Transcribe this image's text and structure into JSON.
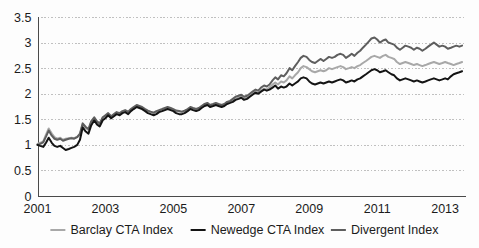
{
  "chart_data": {
    "type": "line",
    "title": "",
    "subtitle": "",
    "xlabel": "",
    "ylabel": "",
    "xlim": [
      2001,
      2013.6
    ],
    "ylim": [
      0,
      3.5
    ],
    "grid": true,
    "grid_axis": "y",
    "legend_position": "bottom",
    "xticks": [
      "2001",
      "2003",
      "2005",
      "2007",
      "2009",
      "2011",
      "2013"
    ],
    "xtick_values": [
      2001,
      2003,
      2005,
      2007,
      2009,
      2011,
      2013
    ],
    "yticks": [
      "0",
      "0.5",
      "1",
      "1.5",
      "2",
      "2.5",
      "3",
      "3.5"
    ],
    "ytick_values": [
      0,
      0.5,
      1,
      1.5,
      2,
      2.5,
      3,
      3.5
    ],
    "x": [
      2001.0,
      2001.08,
      2001.17,
      2001.25,
      2001.33,
      2001.42,
      2001.5,
      2001.58,
      2001.67,
      2001.75,
      2001.83,
      2001.92,
      2002.0,
      2002.08,
      2002.17,
      2002.25,
      2002.33,
      2002.42,
      2002.5,
      2002.58,
      2002.67,
      2002.75,
      2002.83,
      2002.92,
      2003.0,
      2003.08,
      2003.17,
      2003.25,
      2003.33,
      2003.42,
      2003.5,
      2003.58,
      2003.67,
      2003.75,
      2003.83,
      2003.92,
      2004.0,
      2004.08,
      2004.17,
      2004.25,
      2004.33,
      2004.42,
      2004.5,
      2004.58,
      2004.67,
      2004.75,
      2004.83,
      2004.92,
      2005.0,
      2005.08,
      2005.17,
      2005.25,
      2005.33,
      2005.42,
      2005.5,
      2005.58,
      2005.67,
      2005.75,
      2005.83,
      2005.92,
      2006.0,
      2006.08,
      2006.17,
      2006.25,
      2006.33,
      2006.42,
      2006.5,
      2006.58,
      2006.67,
      2006.75,
      2006.83,
      2006.92,
      2007.0,
      2007.08,
      2007.17,
      2007.25,
      2007.33,
      2007.42,
      2007.5,
      2007.58,
      2007.67,
      2007.75,
      2007.83,
      2007.92,
      2008.0,
      2008.08,
      2008.17,
      2008.25,
      2008.33,
      2008.42,
      2008.5,
      2008.58,
      2008.67,
      2008.75,
      2008.83,
      2008.92,
      2009.0,
      2009.08,
      2009.17,
      2009.25,
      2009.33,
      2009.42,
      2009.5,
      2009.58,
      2009.67,
      2009.75,
      2009.83,
      2009.92,
      2010.0,
      2010.08,
      2010.17,
      2010.25,
      2010.33,
      2010.42,
      2010.5,
      2010.58,
      2010.67,
      2010.75,
      2010.83,
      2010.92,
      2011.0,
      2011.08,
      2011.17,
      2011.25,
      2011.33,
      2011.42,
      2011.5,
      2011.58,
      2011.67,
      2011.75,
      2011.83,
      2011.92,
      2012.0,
      2012.08,
      2012.17,
      2012.25,
      2012.33,
      2012.42,
      2012.5,
      2012.58,
      2012.67,
      2012.75,
      2012.83,
      2012.92,
      2013.0,
      2013.08,
      2013.17,
      2013.25,
      2013.33,
      2013.42,
      2013.5
    ],
    "series": [
      {
        "name": "Barclay CTA Index",
        "color": "#a8a8a8",
        "width": 2.0,
        "values": [
          1.02,
          1.04,
          1.07,
          1.2,
          1.32,
          1.22,
          1.15,
          1.12,
          1.14,
          1.1,
          1.12,
          1.13,
          1.14,
          1.13,
          1.16,
          1.2,
          1.4,
          1.33,
          1.29,
          1.44,
          1.52,
          1.44,
          1.4,
          1.52,
          1.56,
          1.6,
          1.55,
          1.58,
          1.62,
          1.6,
          1.64,
          1.66,
          1.63,
          1.68,
          1.72,
          1.76,
          1.74,
          1.72,
          1.68,
          1.66,
          1.64,
          1.62,
          1.64,
          1.66,
          1.68,
          1.7,
          1.72,
          1.7,
          1.68,
          1.66,
          1.65,
          1.64,
          1.66,
          1.68,
          1.72,
          1.7,
          1.68,
          1.7,
          1.74,
          1.78,
          1.8,
          1.76,
          1.78,
          1.8,
          1.78,
          1.76,
          1.78,
          1.82,
          1.84,
          1.86,
          1.9,
          1.92,
          1.94,
          1.9,
          1.92,
          1.96,
          2.0,
          2.04,
          2.02,
          2.06,
          2.1,
          2.08,
          2.12,
          2.18,
          2.22,
          2.18,
          2.24,
          2.22,
          2.26,
          2.34,
          2.3,
          2.36,
          2.42,
          2.5,
          2.54,
          2.52,
          2.48,
          2.44,
          2.42,
          2.44,
          2.46,
          2.44,
          2.46,
          2.5,
          2.48,
          2.5,
          2.52,
          2.54,
          2.52,
          2.48,
          2.5,
          2.52,
          2.5,
          2.54,
          2.56,
          2.6,
          2.64,
          2.68,
          2.72,
          2.74,
          2.72,
          2.7,
          2.74,
          2.76,
          2.72,
          2.7,
          2.68,
          2.62,
          2.58,
          2.6,
          2.62,
          2.6,
          2.58,
          2.56,
          2.58,
          2.56,
          2.54,
          2.56,
          2.58,
          2.6,
          2.62,
          2.6,
          2.58,
          2.6,
          2.62,
          2.6,
          2.58,
          2.56,
          2.58,
          2.6,
          2.62
        ]
      },
      {
        "name": "Newedge CTA Index",
        "color": "#141414",
        "width": 2.0,
        "values": [
          1.0,
          0.98,
          0.96,
          1.04,
          1.14,
          1.04,
          0.98,
          0.96,
          0.98,
          0.94,
          0.9,
          0.92,
          0.94,
          0.96,
          1.0,
          1.1,
          1.34,
          1.26,
          1.22,
          1.38,
          1.48,
          1.4,
          1.36,
          1.48,
          1.52,
          1.58,
          1.52,
          1.56,
          1.6,
          1.58,
          1.62,
          1.64,
          1.6,
          1.66,
          1.7,
          1.74,
          1.72,
          1.7,
          1.66,
          1.62,
          1.6,
          1.58,
          1.6,
          1.64,
          1.66,
          1.68,
          1.7,
          1.68,
          1.66,
          1.62,
          1.6,
          1.6,
          1.62,
          1.66,
          1.7,
          1.68,
          1.66,
          1.68,
          1.72,
          1.76,
          1.78,
          1.74,
          1.76,
          1.78,
          1.76,
          1.74,
          1.76,
          1.8,
          1.82,
          1.84,
          1.88,
          1.9,
          1.92,
          1.88,
          1.9,
          1.94,
          1.98,
          2.02,
          2.0,
          2.04,
          2.08,
          2.06,
          2.08,
          2.12,
          2.16,
          2.1,
          2.14,
          2.12,
          2.14,
          2.2,
          2.16,
          2.2,
          2.24,
          2.3,
          2.32,
          2.3,
          2.24,
          2.2,
          2.18,
          2.2,
          2.22,
          2.2,
          2.22,
          2.24,
          2.22,
          2.24,
          2.26,
          2.28,
          2.26,
          2.22,
          2.24,
          2.26,
          2.24,
          2.28,
          2.3,
          2.34,
          2.38,
          2.42,
          2.46,
          2.48,
          2.46,
          2.42,
          2.44,
          2.46,
          2.42,
          2.38,
          2.36,
          2.3,
          2.26,
          2.28,
          2.3,
          2.28,
          2.26,
          2.24,
          2.26,
          2.24,
          2.22,
          2.24,
          2.26,
          2.28,
          2.3,
          2.28,
          2.26,
          2.28,
          2.3,
          2.28,
          2.34,
          2.38,
          2.4,
          2.42,
          2.44
        ]
      },
      {
        "name": "Divergent Index",
        "color": "#5e5e5e",
        "width": 2.0,
        "values": [
          1.0,
          1.02,
          1.05,
          1.16,
          1.28,
          1.18,
          1.12,
          1.1,
          1.12,
          1.08,
          1.1,
          1.12,
          1.13,
          1.12,
          1.15,
          1.22,
          1.42,
          1.35,
          1.31,
          1.46,
          1.54,
          1.46,
          1.42,
          1.54,
          1.58,
          1.62,
          1.56,
          1.6,
          1.64,
          1.62,
          1.66,
          1.68,
          1.65,
          1.7,
          1.74,
          1.78,
          1.76,
          1.74,
          1.7,
          1.67,
          1.65,
          1.63,
          1.66,
          1.68,
          1.7,
          1.72,
          1.74,
          1.72,
          1.7,
          1.67,
          1.66,
          1.65,
          1.67,
          1.7,
          1.74,
          1.72,
          1.7,
          1.72,
          1.76,
          1.8,
          1.82,
          1.78,
          1.8,
          1.82,
          1.8,
          1.78,
          1.8,
          1.84,
          1.86,
          1.9,
          1.94,
          1.96,
          1.98,
          1.94,
          1.96,
          2.0,
          2.04,
          2.08,
          2.06,
          2.12,
          2.16,
          2.14,
          2.18,
          2.26,
          2.32,
          2.28,
          2.36,
          2.34,
          2.4,
          2.5,
          2.46,
          2.54,
          2.62,
          2.7,
          2.74,
          2.72,
          2.66,
          2.62,
          2.6,
          2.64,
          2.68,
          2.64,
          2.68,
          2.72,
          2.7,
          2.72,
          2.76,
          2.78,
          2.76,
          2.7,
          2.74,
          2.78,
          2.74,
          2.8,
          2.84,
          2.9,
          2.96,
          3.02,
          3.08,
          3.1,
          3.06,
          3.0,
          3.04,
          3.06,
          3.0,
          2.98,
          2.96,
          2.9,
          2.86,
          2.9,
          2.94,
          2.92,
          2.9,
          2.86,
          2.9,
          2.88,
          2.84,
          2.88,
          2.92,
          2.96,
          3.0,
          2.96,
          2.92,
          2.94,
          2.92,
          2.88,
          2.9,
          2.92,
          2.94,
          2.92,
          2.94
        ]
      }
    ]
  },
  "legend": {
    "items": [
      {
        "label": "Barclay CTA Index",
        "color": "#a8a8a8"
      },
      {
        "label": "Newedge CTA Index",
        "color": "#141414"
      },
      {
        "label": "Divergent Index",
        "color": "#5e5e5e"
      }
    ]
  }
}
